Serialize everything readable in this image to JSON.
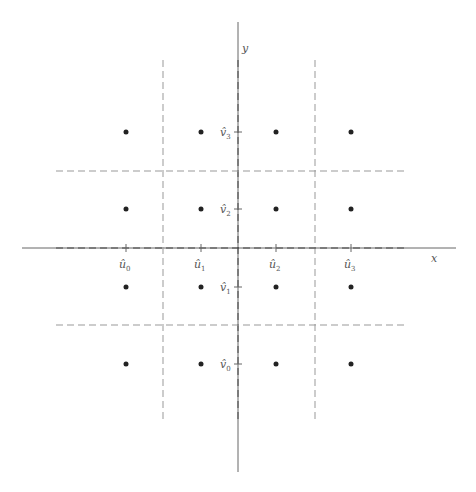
{
  "diagram": {
    "axes": {
      "x_label": "x",
      "y_label": "y",
      "axis_color": "#555555",
      "dash_color": "#9a9a9a",
      "point_color": "#222222"
    },
    "x_ticks": [
      {
        "label": "û",
        "sub": "0",
        "x": 126
      },
      {
        "label": "û",
        "sub": "1",
        "x": 201
      },
      {
        "label": "û",
        "sub": "2",
        "x": 276
      },
      {
        "label": "û",
        "sub": "3",
        "x": 351
      }
    ],
    "y_ticks": [
      {
        "label": "v̂",
        "sub": "3",
        "y": 132
      },
      {
        "label": "v̂",
        "sub": "2",
        "y": 209
      },
      {
        "label": "v̂",
        "sub": "1",
        "y": 287
      },
      {
        "label": "v̂",
        "sub": "0",
        "y": 364
      }
    ],
    "grid_points": "4x4 lattice at (û_i, v̂_j), i,j = 0..3",
    "dashed_partitions": {
      "vertical_x": [
        163,
        238,
        315
      ],
      "horizontal_y": [
        171,
        248,
        325
      ]
    }
  }
}
